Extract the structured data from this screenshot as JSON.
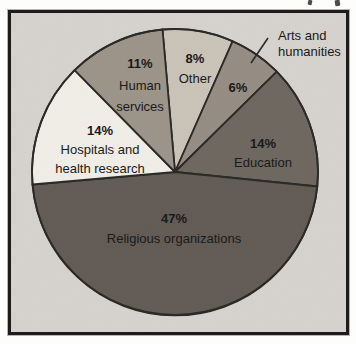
{
  "chart_data": {
    "type": "pie",
    "title": "",
    "legend": "none",
    "direction": "clockwise",
    "start_angle_deg_from_top": -5,
    "center": {
      "x": 175,
      "y": 172
    },
    "radius": 143,
    "frame_background": "#d7d4d0",
    "frame_border_color": "#1d1c1b",
    "slice_stroke": "#2a2926",
    "text_color": "#181818",
    "slices": [
      {
        "name": "Other",
        "pct": 8,
        "color": "#cbc4b9",
        "label_lines": [
          "8%",
          "Other"
        ],
        "label_pos": {
          "x": 195,
          "y": 63,
          "dy": 20
        }
      },
      {
        "name": "Arts and humanities",
        "pct": 6,
        "color": "#968e84",
        "label_lines": [
          "6%"
        ],
        "label_pos": {
          "x": 238,
          "y": 92,
          "dy": 20
        },
        "outside_label": {
          "lines": [
            "Arts and",
            "humanities"
          ],
          "x": 278,
          "y": 40,
          "dy": 16,
          "leader": {
            "x1": 268,
            "y1": 38,
            "x2": 251,
            "y2": 63
          }
        }
      },
      {
        "name": "Education",
        "pct": 14,
        "color": "#6f6860",
        "label_lines": [
          "14%",
          "Education"
        ],
        "label_pos": {
          "x": 263,
          "y": 148,
          "dy": 19
        }
      },
      {
        "name": "Religious organizations",
        "pct": 47,
        "color": "#635c55",
        "label_lines": [
          "47%",
          "Religious organizations"
        ],
        "label_pos": {
          "x": 174,
          "y": 223,
          "dy": 20
        }
      },
      {
        "name": "Hospitals and health research",
        "pct": 14,
        "color": "#f2efe9",
        "label_lines": [
          "14%",
          "Hospitals and",
          "health research"
        ],
        "label_pos": {
          "x": 100,
          "y": 135,
          "dy": 19
        }
      },
      {
        "name": "Human services",
        "pct": 11,
        "color": "#9d958a",
        "label_lines": [
          "11%",
          "Human",
          "services"
        ],
        "label_pos": {
          "x": 140,
          "y": 68,
          "dy": 21.5
        }
      }
    ]
  }
}
